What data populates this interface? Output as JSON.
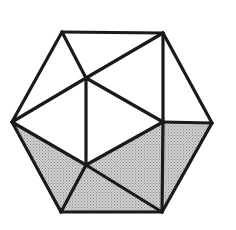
{
  "figure": {
    "canvas": {
      "width": 236,
      "height": 230,
      "background": "#ffffff"
    },
    "colors": {
      "background": "#ffffff",
      "edge": "#1a1a1a",
      "face_plain": "#ffffff",
      "face_shaded": "#bcbcbc",
      "stipple_dot": "#8a8a8a"
    },
    "stroke_width": 3.2,
    "vertices": [
      {
        "id": "top-left",
        "name": "top-left-vertex",
        "x": 62,
        "y": 32
      },
      {
        "id": "top-right",
        "name": "top-right-vertex",
        "x": 163,
        "y": 33
      },
      {
        "id": "right",
        "name": "right-vertex",
        "x": 212,
        "y": 123
      },
      {
        "id": "bottom-right",
        "name": "bottom-right-vertex",
        "x": 162,
        "y": 212
      },
      {
        "id": "bottom-left",
        "name": "bottom-left-vertex",
        "x": 61,
        "y": 212
      },
      {
        "id": "left",
        "name": "left-vertex",
        "x": 12,
        "y": 122
      },
      {
        "id": "inner-upper",
        "name": "inner-upper-vertex",
        "x": 86,
        "y": 78
      },
      {
        "id": "inner-lower",
        "name": "inner-lower-vertex",
        "x": 86,
        "y": 165
      },
      {
        "id": "inner-right",
        "name": "inner-right-vertex",
        "x": 163,
        "y": 122
      }
    ],
    "faces": [
      {
        "id": "f1",
        "name": "face-top-left",
        "shaded": false,
        "points": "62,32 163,33 86,78"
      },
      {
        "id": "f2",
        "name": "face-upper-left-wedge",
        "shaded": false,
        "points": "62,32 86,78 12,122"
      },
      {
        "id": "f3",
        "name": "face-upper-right-wedge",
        "shaded": false,
        "points": "163,33 163,122 86,78"
      },
      {
        "id": "f4",
        "name": "face-top-right-corner",
        "shaded": false,
        "points": "163,33 212,123 163,122"
      },
      {
        "id": "f5",
        "name": "face-center-left",
        "shaded": false,
        "points": "12,122 86,78 86,165"
      },
      {
        "id": "f6",
        "name": "face-center-right",
        "shaded": false,
        "points": "86,78 163,122 86,165"
      },
      {
        "id": "f7",
        "name": "face-lower-left",
        "shaded": true,
        "points": "12,122 86,165 61,212"
      },
      {
        "id": "f8",
        "name": "face-bottom-center",
        "shaded": true,
        "points": "61,212 86,165 162,212"
      },
      {
        "id": "f9",
        "name": "face-lower-right",
        "shaded": true,
        "points": "86,165 163,122 162,212"
      },
      {
        "id": "f10",
        "name": "face-right-corner",
        "shaded": true,
        "points": "163,122 212,123 162,212"
      }
    ],
    "edges": [
      {
        "id": "e1",
        "name": "edge-hex-top",
        "x1": 62,
        "y1": 32,
        "x2": 163,
        "y2": 33
      },
      {
        "id": "e2",
        "name": "edge-hex-upper-right",
        "x1": 163,
        "y1": 33,
        "x2": 212,
        "y2": 123
      },
      {
        "id": "e3",
        "name": "edge-hex-lower-right",
        "x1": 212,
        "y1": 123,
        "x2": 162,
        "y2": 212
      },
      {
        "id": "e4",
        "name": "edge-hex-bottom",
        "x1": 162,
        "y1": 212,
        "x2": 61,
        "y2": 212
      },
      {
        "id": "e5",
        "name": "edge-hex-lower-left",
        "x1": 61,
        "y1": 212,
        "x2": 12,
        "y2": 122
      },
      {
        "id": "e6",
        "name": "edge-hex-upper-left",
        "x1": 12,
        "y1": 122,
        "x2": 62,
        "y2": 32
      },
      {
        "id": "e7",
        "name": "edge-topleft-to-inner-up",
        "x1": 62,
        "y1": 32,
        "x2": 86,
        "y2": 78
      },
      {
        "id": "e8",
        "name": "edge-topright-to-inner-up",
        "x1": 163,
        "y1": 33,
        "x2": 86,
        "y2": 78
      },
      {
        "id": "e9",
        "name": "edge-left-to-inner-up",
        "x1": 12,
        "y1": 122,
        "x2": 86,
        "y2": 78
      },
      {
        "id": "e10",
        "name": "edge-inner-vertical",
        "x1": 86,
        "y1": 78,
        "x2": 86,
        "y2": 165
      },
      {
        "id": "e11",
        "name": "edge-inner-up-to-right",
        "x1": 86,
        "y1": 78,
        "x2": 163,
        "y2": 122
      },
      {
        "id": "e12",
        "name": "edge-topright-vertical",
        "x1": 163,
        "y1": 33,
        "x2": 163,
        "y2": 122
      },
      {
        "id": "e13",
        "name": "edge-inner-right-to-right",
        "x1": 163,
        "y1": 122,
        "x2": 212,
        "y2": 123
      },
      {
        "id": "e14",
        "name": "edge-left-to-inner-low",
        "x1": 12,
        "y1": 122,
        "x2": 86,
        "y2": 165
      },
      {
        "id": "e15",
        "name": "edge-inner-low-to-right",
        "x1": 86,
        "y1": 165,
        "x2": 163,
        "y2": 122
      },
      {
        "id": "e16",
        "name": "edge-inner-low-to-botleft",
        "x1": 86,
        "y1": 165,
        "x2": 61,
        "y2": 212
      },
      {
        "id": "e17",
        "name": "edge-inner-low-to-botright",
        "x1": 86,
        "y1": 165,
        "x2": 162,
        "y2": 212
      },
      {
        "id": "e18",
        "name": "edge-inner-right-to-botrt",
        "x1": 163,
        "y1": 122,
        "x2": 162,
        "y2": 212
      }
    ]
  }
}
